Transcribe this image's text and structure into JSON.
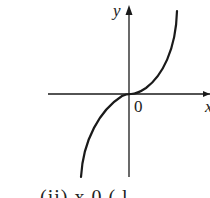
{
  "figure": {
    "axis_labels": {
      "y": "y",
      "x": "x",
      "origin": "0"
    },
    "curve": "cubic-shaped increasing curve passing through origin with horizontal inflection at 0",
    "caption_partial": "(ii)   x   0   (   l",
    "colors": {
      "stroke": "#1a1a1a",
      "background": "#ffffff"
    }
  }
}
